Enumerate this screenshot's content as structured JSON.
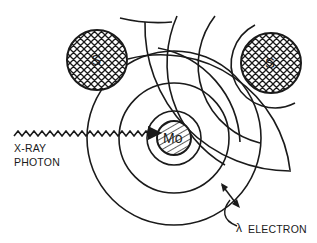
{
  "diagram": {
    "type": "EXAFS photoelectron scattering schematic",
    "colors": {
      "ink": "#1a1a1a",
      "background": "#ffffff"
    },
    "absorber": {
      "label": "Mo",
      "fill": "diagonal-hatch"
    },
    "scatterers": [
      {
        "id": "left",
        "label": "S",
        "fill": "cross-hatch"
      },
      {
        "id": "right",
        "label": "S",
        "fill": "cross-hatch"
      }
    ],
    "photon": {
      "label_line1": "X-RAY",
      "label_line2": "PHOTON"
    },
    "electron": {
      "symbol": "λ",
      "label": "ELECTRON"
    }
  }
}
